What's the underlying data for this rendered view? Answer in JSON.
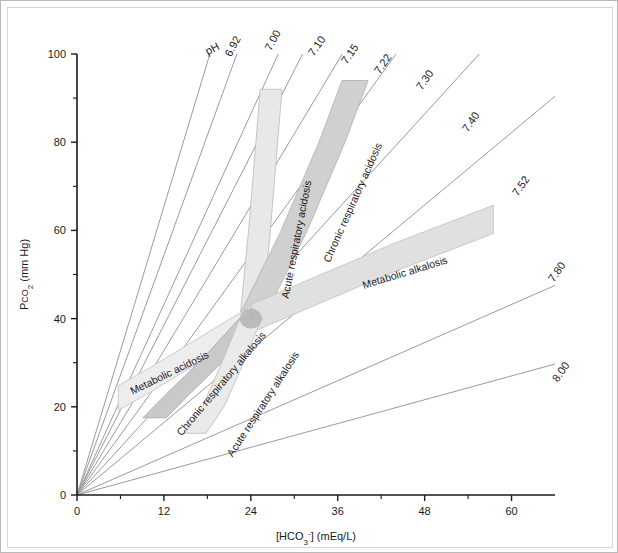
{
  "figure": {
    "type": "acid-base-nomogram",
    "background": "#ffffff",
    "frame_color": "#b9b9b9"
  },
  "axes": {
    "x": {
      "label": "[HCO3-] (mEq/L)",
      "label_parts": {
        "pre": "[HCO",
        "sub": "3",
        "sup": "-",
        "post": "] (mEq/L)"
      },
      "min": 0,
      "max": 66,
      "ticks": [
        0,
        12,
        24,
        36,
        48,
        60
      ],
      "tick_labels": [
        "0",
        "12",
        "24",
        "36",
        "48",
        "60"
      ],
      "minor_ticks": [
        6,
        18,
        30,
        42,
        54
      ]
    },
    "y": {
      "label": "Pco2 (mm Hg)",
      "label_parts": {
        "pre": "P",
        "sc": "CO",
        "sub": "2",
        "post": " (mm Hg)"
      },
      "min": 0,
      "max": 100,
      "ticks": [
        0,
        20,
        40,
        60,
        80,
        100
      ],
      "tick_labels": [
        "0",
        "20",
        "40",
        "60",
        "80",
        "100"
      ],
      "minor_ticks": [
        10,
        30,
        50,
        70,
        90
      ]
    },
    "axis_color": "#1a1a1a"
  },
  "chart_data": {
    "type": "line",
    "title": "",
    "xlabel": "[HCO3-] (mEq/L)",
    "ylabel": "Pco2 (mm Hg)",
    "xlim": [
      0,
      66
    ],
    "ylim": [
      0,
      100
    ],
    "grid": false,
    "legend_position": "none",
    "normal_point": {
      "hco3": 24,
      "pco2": 40,
      "color": "#b3b3b3"
    },
    "ph_isopleths": {
      "description": "Straight iso-pH rays from the origin; pH = 6.1 + log10([HCO3-]/(0.03*Pco2))",
      "color": "#9a9a9a",
      "line_width": 1,
      "lines": [
        {
          "ph": "6.92",
          "label": "6.92",
          "slope_pco2_per_hco3": 5.45,
          "label_x": 228,
          "label_y": 40,
          "label_rot": -62
        },
        {
          "ph": "7.00",
          "label": "7.00",
          "slope_pco2_per_hco3": 4.53,
          "label_x": 268,
          "label_y": 34,
          "label_rot": -62
        },
        {
          "ph": "7.10",
          "label": "7.10",
          "slope_pco2_per_hco3": 3.6,
          "label_x": 312,
          "label_y": 40,
          "label_rot": -55
        },
        {
          "ph": "7.15",
          "label": "7.15",
          "slope_pco2_per_hco3": 3.21,
          "label_x": 345,
          "label_y": 48,
          "label_rot": -55
        },
        {
          "ph": "7.22",
          "label": "7.22",
          "slope_pco2_per_hco3": 2.73,
          "label_x": 378,
          "label_y": 58,
          "label_rot": -55
        },
        {
          "ph": "7.30",
          "label": "7.30",
          "slope_pco2_per_hco3": 2.27,
          "label_x": 420,
          "label_y": 74,
          "label_rot": -55
        },
        {
          "ph": "7.40",
          "label": "7.40",
          "slope_pco2_per_hco3": 1.8,
          "label_x": 466,
          "label_y": 116,
          "label_rot": -55
        },
        {
          "ph": "7.52",
          "label": "7.52",
          "slope_pco2_per_hco3": 1.37,
          "label_x": 516,
          "label_y": 180,
          "label_rot": -55
        },
        {
          "ph": "7.80",
          "label": "7.80",
          "slope_pco2_per_hco3": 0.72,
          "label_x": 552,
          "label_y": 266,
          "label_rot": -55
        },
        {
          "ph": "8.00",
          "label": "8.00",
          "slope_pco2_per_hco3": 0.45,
          "label_x": 556,
          "label_y": 366,
          "label_rot": -55
        }
      ]
    },
    "bands": [
      {
        "name": "acute-respiratory-acidosis",
        "label": "Acute respiratory acidosis",
        "fill": "#e8e8e8",
        "stroke": "#c0c0c0",
        "label_x": 292,
        "label_y": 232,
        "label_rot": -79,
        "center": [
          [
            24,
            40
          ],
          [
            25.2,
            60
          ],
          [
            26.2,
            80
          ],
          [
            26.8,
            92
          ]
        ],
        "half_width_hco3": 1.5
      },
      {
        "name": "chronic-respiratory-acidosis",
        "label": "Chronic respiratory acidosis",
        "fill": "#d0d0d0",
        "stroke": "#b4b4b4",
        "label_x": 348,
        "label_y": 196,
        "label_rot": -66,
        "center": [
          [
            24,
            40
          ],
          [
            30,
            60
          ],
          [
            35.2,
            80
          ],
          [
            38.4,
            94
          ]
        ],
        "half_width_hco3": 1.8
      },
      {
        "name": "metabolic-alkalosis",
        "label": "Metabolic alkalosis",
        "fill": "#e0e0e0",
        "stroke": "#c4c4c4",
        "label_x": 398,
        "label_y": 268,
        "label_rot": -17,
        "center": [
          [
            24,
            40
          ],
          [
            34,
            47
          ],
          [
            44,
            54
          ],
          [
            57.5,
            62.5
          ]
        ],
        "half_width_pco2": 3.2
      },
      {
        "name": "metabolic-acidosis",
        "label": "Metabolic acidosis",
        "fill": "#ededed",
        "stroke": "#c6c6c6",
        "label_x": 163,
        "label_y": 368,
        "label_rot": -26,
        "center": [
          [
            24,
            40
          ],
          [
            16,
            32
          ],
          [
            10,
            26
          ],
          [
            5.7,
            22
          ]
        ],
        "half_width_pco2": 2.8
      },
      {
        "name": "chronic-respiratory-alkalosis",
        "label": "Chronic respiratory alkalosis",
        "fill": "#c9c9c9",
        "stroke": "#ababab",
        "label_x": 216,
        "label_y": 378,
        "label_rot": -50,
        "center": [
          [
            24,
            40
          ],
          [
            19,
            31
          ],
          [
            14,
            23
          ],
          [
            10.7,
            17.5
          ]
        ],
        "half_width_hco3": 1.6
      },
      {
        "name": "acute-respiratory-alkalosis",
        "label": "Acute respiratory alkalosis",
        "fill": "#eaeaea",
        "stroke": "#c2c2c2",
        "label_x": 258,
        "label_y": 398,
        "label_rot": -57,
        "center": [
          [
            24,
            40
          ],
          [
            21.5,
            30
          ],
          [
            18.8,
            20
          ],
          [
            16.3,
            14
          ]
        ],
        "half_width_hco3": 1.5
      }
    ],
    "ph_prefix_label": "pH"
  }
}
